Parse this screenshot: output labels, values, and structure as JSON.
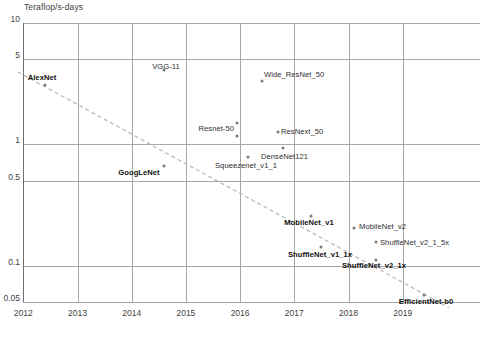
{
  "chart_data": {
    "type": "scatter",
    "title": "",
    "ylabel": "Teraflop/s-days",
    "xlabel": "",
    "yscale": "log",
    "ylim": [
      0.05,
      10
    ],
    "xlim": [
      2012,
      2019.8
    ],
    "grid": true,
    "legend": "none",
    "ytick_labels": [
      "10",
      "5",
      "1",
      "0.5",
      "0.1",
      "0.05"
    ],
    "ytick_values": [
      10,
      5,
      1,
      0.5,
      0.1,
      0.05
    ],
    "xtick_labels": [
      "2012",
      "2013",
      "2014",
      "2015",
      "2016",
      "2017",
      "2018",
      "2019"
    ],
    "xtick_values": [
      2012,
      2013,
      2014,
      2015,
      2016,
      2017,
      2018,
      2019
    ],
    "points": [
      {
        "label": "AlexNet",
        "x": 2012.4,
        "y": 3.1,
        "bold": true,
        "lx": 42,
        "ly": 73,
        "align": "c"
      },
      {
        "label": "VGG-11",
        "x": 2014.6,
        "y": 4.1,
        "bold": false,
        "lx": 166,
        "ly": 62,
        "align": "c"
      },
      {
        "label": "Wide_ResNet_50",
        "x": 2016.4,
        "y": 3.3,
        "bold": false,
        "lx": 264,
        "ly": 70,
        "align": "l"
      },
      {
        "label": "Resnet-50",
        "x": 2015.95,
        "y": 1.5,
        "bold": false,
        "lx": 234,
        "ly": 124,
        "align": "r"
      },
      {
        "label": "ResNext_50",
        "x": 2016.7,
        "y": 1.25,
        "bold": false,
        "lx": 281,
        "ly": 127,
        "align": "l"
      },
      {
        "label": "DenseNet121",
        "x": 2016.8,
        "y": 0.93,
        "bold": false,
        "lx": 261,
        "ly": 152,
        "align": "l"
      },
      {
        "label": "Squeezenet_v1_1",
        "x": 2016.15,
        "y": 0.78,
        "bold": false,
        "lx": 215,
        "ly": 161,
        "align": "l"
      },
      {
        "label": "GoogLeNet",
        "x": 2014.6,
        "y": 0.66,
        "bold": true,
        "lx": 139,
        "ly": 168,
        "align": "c"
      },
      {
        "label": "MobileNet_v1",
        "x": 2017.3,
        "y": 0.255,
        "bold": true,
        "lx": 309,
        "ly": 218,
        "align": "c"
      },
      {
        "label": "MobileNet_v2",
        "x": 2018.1,
        "y": 0.205,
        "bold": false,
        "lx": 359,
        "ly": 222,
        "align": "l"
      },
      {
        "label": "ShuffleNet_v2_1_5x",
        "x": 2018.5,
        "y": 0.155,
        "bold": false,
        "lx": 380,
        "ly": 238,
        "align": "l"
      },
      {
        "label": "ShuffleNet_v1_1x",
        "x": 2017.5,
        "y": 0.142,
        "bold": true,
        "lx": 320,
        "ly": 250,
        "align": "c"
      },
      {
        "label": "ShuffleNet_v2_1x",
        "x": 2018.5,
        "y": 0.112,
        "bold": true,
        "lx": 374,
        "ly": 261,
        "align": "c"
      },
      {
        "label": "EfficientNet-b0",
        "x": 2019.4,
        "y": 0.057,
        "bold": true,
        "lx": 426,
        "ly": 297,
        "align": "c"
      }
    ],
    "trendline": {
      "style": "dashed",
      "color": "#b5b5b5",
      "start": {
        "x": 2011.9,
        "y": 3.95
      },
      "end": {
        "x": 2019.85,
        "y": 0.045
      }
    }
  }
}
